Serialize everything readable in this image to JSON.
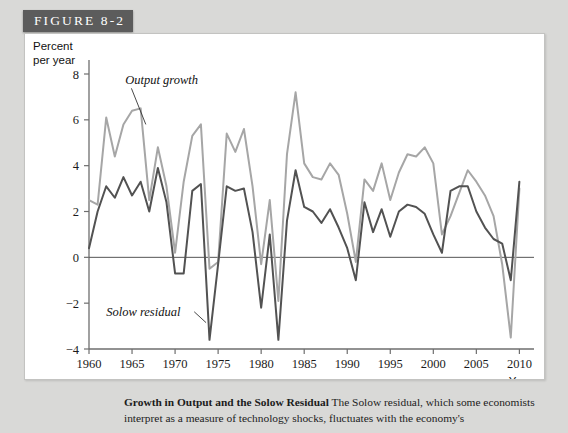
{
  "figure": {
    "banner_label": "FIGURE 8-2"
  },
  "caption": {
    "title": "Growth in Output and the Solow Residual",
    "body": " The Solow residual, which some economists interpret as a measure of technology shocks, fluctuates with the economy's"
  },
  "chart_data": {
    "type": "line",
    "title": "",
    "xlabel": "Year",
    "ylabel": "Percent per year",
    "ylabel_lines": [
      "Percent",
      "per year"
    ],
    "xlim": [
      1960,
      2011
    ],
    "ylim": [
      -4,
      8.8
    ],
    "yticks": [
      -4,
      -2,
      0,
      2,
      4,
      6,
      8
    ],
    "ytick_labels": [
      "−4",
      "−2",
      "0",
      "2",
      "4",
      "6",
      "8"
    ],
    "xticks": [
      1960,
      1965,
      1970,
      1975,
      1980,
      1985,
      1990,
      1995,
      2000,
      2005,
      2010
    ],
    "xtick_labels": [
      "1960",
      "1965",
      "1970",
      "1975",
      "1980",
      "1985",
      "1990",
      "1995",
      "2000",
      "2005",
      "2010"
    ],
    "grid": false,
    "zero_line": true,
    "legend_position": "inline-annotations",
    "annotations": [
      {
        "name": "output-growth",
        "text": "Output growth",
        "x": 1964.2,
        "y": 7.55,
        "leader_to_x": 1966.6,
        "leader_to_y": 5.8
      },
      {
        "name": "solow-residual",
        "text": "Solow residual",
        "x": 1962.0,
        "y": -2.55,
        "leader_to_x": 1973.6,
        "leader_to_y": -2.85
      }
    ],
    "x": [
      1960,
      1961,
      1962,
      1963,
      1964,
      1965,
      1966,
      1967,
      1968,
      1969,
      1970,
      1971,
      1972,
      1973,
      1974,
      1975,
      1976,
      1977,
      1978,
      1979,
      1980,
      1981,
      1982,
      1983,
      1984,
      1985,
      1986,
      1987,
      1988,
      1989,
      1990,
      1991,
      1992,
      1993,
      1994,
      1995,
      1996,
      1997,
      1998,
      1999,
      2000,
      2001,
      2002,
      2003,
      2004,
      2005,
      2006,
      2007,
      2008,
      2009,
      2010
    ],
    "series": [
      {
        "name": "Output growth",
        "color": "#a6a6a6",
        "values": [
          2.5,
          2.3,
          6.1,
          4.4,
          5.8,
          6.4,
          6.5,
          2.5,
          4.8,
          3.1,
          0.2,
          3.3,
          5.3,
          5.8,
          -0.5,
          -0.2,
          5.4,
          4.6,
          5.6,
          3.1,
          -0.3,
          2.5,
          -1.9,
          4.5,
          7.2,
          4.1,
          3.5,
          3.4,
          4.1,
          3.6,
          1.9,
          -0.2,
          3.4,
          2.9,
          4.1,
          2.5,
          3.7,
          4.5,
          4.4,
          4.8,
          4.1,
          1.0,
          1.8,
          2.8,
          3.8,
          3.3,
          2.7,
          1.8,
          -0.3,
          -3.5,
          3.0
        ]
      },
      {
        "name": "Solow residual",
        "color": "#525252",
        "values": [
          0.4,
          2.0,
          3.1,
          2.6,
          3.5,
          2.7,
          3.3,
          2.0,
          3.9,
          2.4,
          -0.7,
          -0.7,
          2.9,
          3.2,
          -3.6,
          -0.3,
          3.1,
          2.9,
          3.0,
          1.1,
          -2.2,
          1.0,
          -3.6,
          1.6,
          3.8,
          2.2,
          2.0,
          1.5,
          2.1,
          1.3,
          0.4,
          -1.0,
          2.4,
          1.1,
          2.1,
          0.9,
          2.0,
          2.3,
          2.2,
          1.9,
          1.0,
          0.2,
          2.9,
          3.1,
          3.1,
          2.0,
          1.3,
          0.8,
          0.6,
          -1.0,
          3.3
        ]
      }
    ]
  }
}
